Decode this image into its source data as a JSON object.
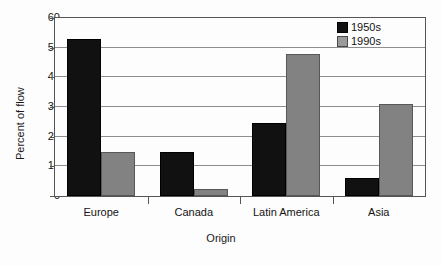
{
  "chart_data": {
    "type": "bar",
    "title": "",
    "subtitle": "",
    "xlabel": "Origin",
    "ylabel": "Percent of flow",
    "categories": [
      "Europe",
      "Canada",
      "Latin America",
      "Asia"
    ],
    "series": [
      {
        "name": "1950s",
        "color": "#111111",
        "values": [
          53,
          15,
          24.5,
          6
        ]
      },
      {
        "name": "1990s",
        "color": "#828282",
        "values": [
          15,
          2.5,
          48,
          31
        ]
      }
    ],
    "ylim": [
      0,
      60
    ],
    "yticks": [
      0,
      10,
      20,
      30,
      40,
      50,
      60
    ],
    "ytick_labels": [
      "0",
      "10",
      "20",
      "30",
      "40",
      "50",
      "60"
    ],
    "grid": true,
    "grid_axis": "y",
    "legend_position": "top-right",
    "legend_entries": [
      "1950s",
      "1990s"
    ]
  },
  "legend": {
    "items": [
      {
        "label": "1950s"
      },
      {
        "label": "1990s"
      }
    ]
  },
  "axes": {
    "y_title": "Percent of flow",
    "x_title": "Origin",
    "y_labels": [
      "60",
      "50",
      "40",
      "30",
      "20",
      "10",
      "0"
    ],
    "x_labels": [
      "Europe",
      "Canada",
      "Latin America",
      "Asia"
    ]
  }
}
